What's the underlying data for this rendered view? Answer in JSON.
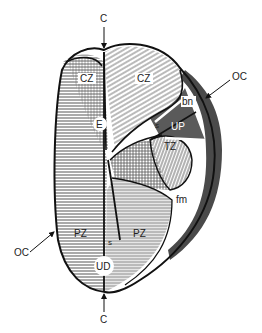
{
  "figure": {
    "colors": {
      "outline": "#111111",
      "hatch": "#555555",
      "dark_band": "#4a4a4a",
      "light_fill": "#e8e8e8",
      "background": "#ffffff"
    }
  },
  "labels": {
    "c_top": "C",
    "c_bottom": "C",
    "oc_right": "OC",
    "oc_left": "OC",
    "cz_left": "CZ",
    "cz_right": "CZ",
    "e": "E",
    "bn": "bn",
    "up": "UP",
    "s_upper": "s",
    "tz": "TZ",
    "fm": "fm",
    "pz_left": "PZ",
    "pz_right": "PZ",
    "s_lower": "s",
    "ud": "UD"
  }
}
